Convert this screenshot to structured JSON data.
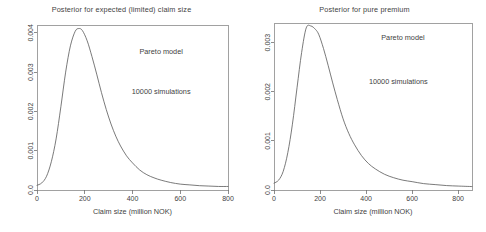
{
  "figure": {
    "background": "#ffffff",
    "width": 486,
    "height": 232,
    "panel_count": 2
  },
  "chart_data": [
    {
      "type": "line",
      "panel": "left",
      "title": "Posterior for expected (limited) claim size",
      "xlabel": "Claim size (million NOK)",
      "ylabel": "",
      "xlim": [
        0,
        800
      ],
      "ylim": [
        0,
        0.0042
      ],
      "grid": false,
      "legend": "none",
      "xticks": [
        0,
        200,
        400,
        600,
        800
      ],
      "xticklabels": [
        "0",
        "200",
        "400",
        "600",
        "800"
      ],
      "yticks": [
        0.0,
        0.001,
        0.002,
        0.003,
        0.004
      ],
      "yticklabels": [
        "0.0",
        "0.001",
        "0.002",
        "0.003",
        "0.004"
      ],
      "annotations": [
        {
          "text": "Pareto model",
          "x": 520,
          "y": 0.00345
        },
        {
          "text": "10000 simulations",
          "x": 520,
          "y": 0.00245
        }
      ],
      "series": [
        {
          "name": "posterior density of expected (limited) claim size",
          "x": [
            0,
            20,
            40,
            60,
            80,
            100,
            120,
            140,
            160,
            175,
            190,
            210,
            230,
            250,
            270,
            290,
            310,
            330,
            350,
            375,
            400,
            430,
            460,
            490,
            520,
            560,
            600,
            640,
            680,
            720,
            760,
            800
          ],
          "y": [
            0.00012,
            0.00018,
            0.00035,
            0.00072,
            0.0013,
            0.00212,
            0.003,
            0.00367,
            0.00404,
            0.00411,
            0.00406,
            0.0038,
            0.0034,
            0.00295,
            0.00248,
            0.00205,
            0.00168,
            0.00137,
            0.00112,
            0.00087,
            0.00069,
            0.00051,
            0.00039,
            0.00031,
            0.00025,
            0.00019,
            0.00015,
            0.00013,
            0.00011,
            0.0001,
            9e-05,
            9e-05
          ]
        }
      ]
    },
    {
      "type": "line",
      "panel": "right",
      "title": "Posterior for pure premium",
      "xlabel": "Claim size (million NOK)",
      "ylabel": "",
      "xlim": [
        0,
        860
      ],
      "ylim": [
        0,
        0.0034
      ],
      "grid": false,
      "legend": "none",
      "xticks": [
        0,
        200,
        400,
        600,
        800
      ],
      "xticklabels": [
        "0",
        "200",
        "400",
        "600",
        "800"
      ],
      "yticks": [
        0.0,
        0.001,
        0.002,
        0.003
      ],
      "yticklabels": [
        "0.0",
        "0.001",
        "0.002",
        "0.003"
      ],
      "annotations": [
        {
          "text": "Pareto model",
          "x": 560,
          "y": 0.00305
        },
        {
          "text": "10000 simulations",
          "x": 540,
          "y": 0.00215
        }
      ],
      "series": [
        {
          "name": "posterior density of pure premium",
          "x": [
            0,
            20,
            40,
            60,
            80,
            100,
            120,
            140,
            160,
            180,
            195,
            215,
            235,
            255,
            275,
            300,
            325,
            350,
            380,
            410,
            440,
            480,
            520,
            560,
            600,
            650,
            700,
            750,
            800,
            860
          ],
          "y": [
            0.00014,
            0.0002,
            0.00038,
            0.00076,
            0.00134,
            0.00208,
            0.0028,
            0.0033,
            0.00334,
            0.00327,
            0.00316,
            0.00288,
            0.00254,
            0.00218,
            0.00184,
            0.00145,
            0.00115,
            0.00092,
            0.0007,
            0.00054,
            0.00043,
            0.00032,
            0.00025,
            0.0002,
            0.00017,
            0.00013,
            0.00011,
            9e-05,
            8e-05,
            7e-05
          ]
        }
      ]
    }
  ]
}
